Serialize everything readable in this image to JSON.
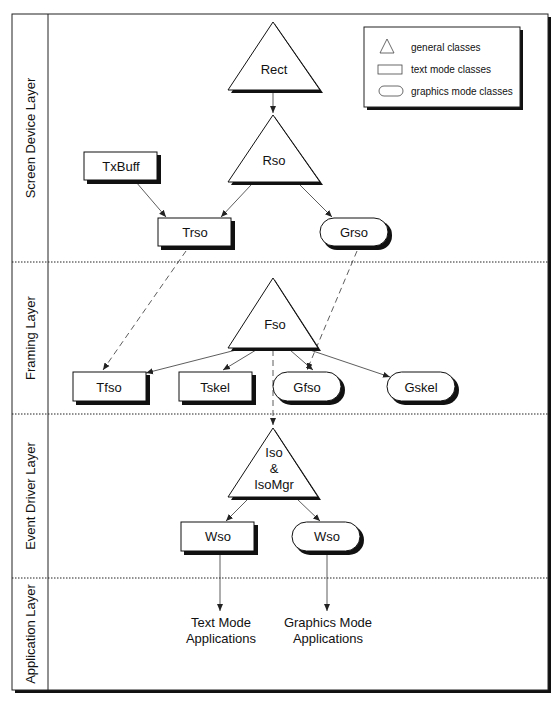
{
  "layers": [
    {
      "id": "screen-device",
      "label": "Screen Device Layer"
    },
    {
      "id": "framing",
      "label": "Framing Layer"
    },
    {
      "id": "event-driver",
      "label": "Event Driver Layer"
    },
    {
      "id": "application",
      "label": "Application Layer"
    }
  ],
  "legend": {
    "items": [
      {
        "shape": "triangle",
        "label": "general classes"
      },
      {
        "shape": "rectangle",
        "label": "text mode classes"
      },
      {
        "shape": "rounded",
        "label": "graphics mode classes"
      }
    ]
  },
  "nodes": {
    "rect": {
      "label": "Rect",
      "shape": "triangle"
    },
    "rso": {
      "label": "Rso",
      "shape": "triangle"
    },
    "txbuff": {
      "label": "TxBuff",
      "shape": "rectangle"
    },
    "trso": {
      "label": "Trso",
      "shape": "rectangle"
    },
    "grso": {
      "label": "Grso",
      "shape": "rounded"
    },
    "fso": {
      "label": "Fso",
      "shape": "triangle"
    },
    "tfso": {
      "label": "Tfso",
      "shape": "rectangle"
    },
    "tskel": {
      "label": "Tskel",
      "shape": "rectangle"
    },
    "gfso": {
      "label": "Gfso",
      "shape": "rounded"
    },
    "gskel": {
      "label": "Gskel",
      "shape": "rounded"
    },
    "iso": {
      "label_lines": [
        "Iso",
        "&",
        "IsoMgr"
      ],
      "shape": "triangle"
    },
    "wso_text": {
      "label": "Wso",
      "shape": "rectangle"
    },
    "wso_graphics": {
      "label": "Wso",
      "shape": "rounded"
    },
    "text_apps": {
      "label_lines": [
        "Text Mode",
        "Applications"
      ],
      "shape": "text"
    },
    "graphics_apps": {
      "label_lines": [
        "Graphics Mode",
        "Applications"
      ],
      "shape": "text"
    }
  },
  "edges": [
    {
      "from": "rect",
      "to": "rso",
      "style": "solid"
    },
    {
      "from": "txbuff",
      "to": "trso",
      "style": "solid"
    },
    {
      "from": "rso",
      "to": "trso",
      "style": "solid"
    },
    {
      "from": "rso",
      "to": "grso",
      "style": "solid"
    },
    {
      "from": "trso",
      "to": "tfso",
      "style": "dashed"
    },
    {
      "from": "grso",
      "to": "gfso",
      "style": "dashed"
    },
    {
      "from": "fso",
      "to": "tfso",
      "style": "solid"
    },
    {
      "from": "fso",
      "to": "tskel",
      "style": "solid"
    },
    {
      "from": "fso",
      "to": "gfso",
      "style": "solid"
    },
    {
      "from": "fso",
      "to": "gskel",
      "style": "solid"
    },
    {
      "from": "fso",
      "to": "iso",
      "style": "dashed"
    },
    {
      "from": "iso",
      "to": "wso_text",
      "style": "solid"
    },
    {
      "from": "iso",
      "to": "wso_graphics",
      "style": "solid"
    },
    {
      "from": "wso_text",
      "to": "text_apps",
      "style": "solid"
    },
    {
      "from": "wso_graphics",
      "to": "graphics_apps",
      "style": "solid"
    }
  ]
}
